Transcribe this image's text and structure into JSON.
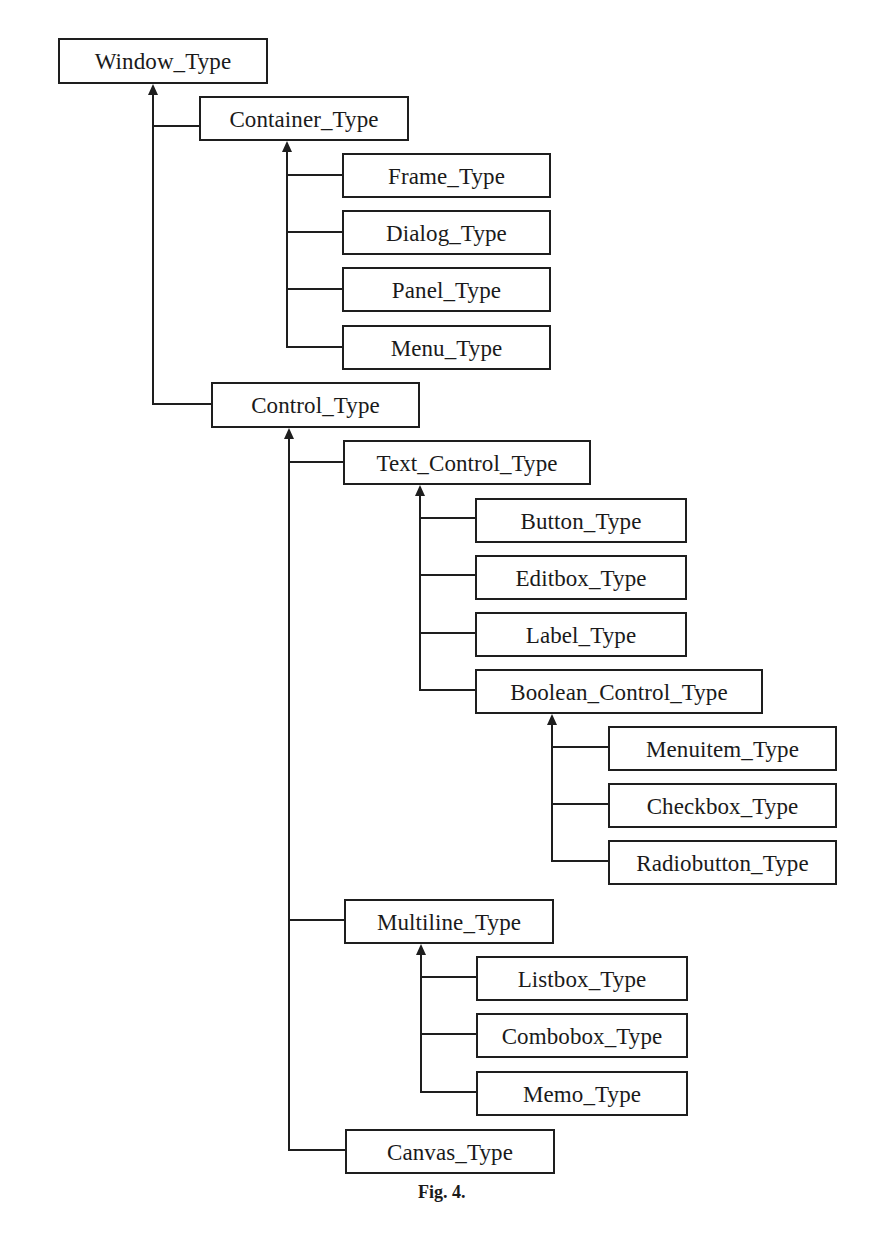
{
  "figure": {
    "caption": "Fig. 4.",
    "caption_pos": {
      "x": 418,
      "y": 1182
    },
    "line_color": "#1e1e1e",
    "background": "#ffffff"
  },
  "nodes": [
    {
      "id": "window",
      "label": "Window_Type",
      "x": 58,
      "y": 38,
      "w": 210,
      "h": 46
    },
    {
      "id": "container",
      "label": "Container_Type",
      "x": 199,
      "y": 96,
      "w": 210,
      "h": 45
    },
    {
      "id": "frame",
      "label": "Frame_Type",
      "x": 342,
      "y": 153,
      "w": 209,
      "h": 45
    },
    {
      "id": "dialog",
      "label": "Dialog_Type",
      "x": 342,
      "y": 210,
      "w": 209,
      "h": 45
    },
    {
      "id": "panel",
      "label": "Panel_Type",
      "x": 342,
      "y": 267,
      "w": 209,
      "h": 45
    },
    {
      "id": "menu",
      "label": "Menu_Type",
      "x": 342,
      "y": 325,
      "w": 209,
      "h": 45
    },
    {
      "id": "control",
      "label": "Control_Type",
      "x": 211,
      "y": 382,
      "w": 209,
      "h": 46
    },
    {
      "id": "textcontrol",
      "label": "Text_Control_Type",
      "x": 343,
      "y": 440,
      "w": 248,
      "h": 45
    },
    {
      "id": "button",
      "label": "Button_Type",
      "x": 475,
      "y": 498,
      "w": 212,
      "h": 45
    },
    {
      "id": "editbox",
      "label": "Editbox_Type",
      "x": 475,
      "y": 555,
      "w": 212,
      "h": 45
    },
    {
      "id": "label",
      "label": "Label_Type",
      "x": 475,
      "y": 612,
      "w": 212,
      "h": 45
    },
    {
      "id": "boolean",
      "label": "Boolean_Control_Type",
      "x": 475,
      "y": 669,
      "w": 288,
      "h": 45
    },
    {
      "id": "menuitem",
      "label": "Menuitem_Type",
      "x": 608,
      "y": 726,
      "w": 229,
      "h": 45
    },
    {
      "id": "checkbox",
      "label": "Checkbox_Type",
      "x": 608,
      "y": 783,
      "w": 229,
      "h": 45
    },
    {
      "id": "radiobutton",
      "label": "Radiobutton_Type",
      "x": 608,
      "y": 840,
      "w": 229,
      "h": 45
    },
    {
      "id": "multiline",
      "label": "Multiline_Type",
      "x": 344,
      "y": 899,
      "w": 210,
      "h": 45
    },
    {
      "id": "listbox",
      "label": "Listbox_Type",
      "x": 476,
      "y": 956,
      "w": 212,
      "h": 45
    },
    {
      "id": "combobox",
      "label": "Combobox_Type",
      "x": 476,
      "y": 1013,
      "w": 212,
      "h": 45
    },
    {
      "id": "memo",
      "label": "Memo_Type",
      "x": 476,
      "y": 1071,
      "w": 212,
      "h": 45
    },
    {
      "id": "canvas",
      "label": "Canvas_Type",
      "x": 345,
      "y": 1129,
      "w": 210,
      "h": 45
    }
  ],
  "trunks": [
    {
      "parent": "window",
      "x": 153,
      "top": 84,
      "bottom": 404,
      "children": [
        {
          "child": "container",
          "y": 126,
          "to_x": 199
        },
        {
          "child": "control",
          "y": 404,
          "to_x": 211
        }
      ]
    },
    {
      "parent": "container",
      "x": 287,
      "top": 141,
      "bottom": 347,
      "children": [
        {
          "child": "frame",
          "y": 175,
          "to_x": 342
        },
        {
          "child": "dialog",
          "y": 232,
          "to_x": 342
        },
        {
          "child": "panel",
          "y": 289,
          "to_x": 342
        },
        {
          "child": "menu",
          "y": 347,
          "to_x": 342
        }
      ]
    },
    {
      "parent": "control",
      "x": 289,
      "top": 428,
      "bottom": 1150,
      "children": [
        {
          "child": "textcontrol",
          "y": 462,
          "to_x": 343
        },
        {
          "child": "multiline",
          "y": 920,
          "to_x": 344
        },
        {
          "child": "canvas",
          "y": 1150,
          "to_x": 345
        }
      ]
    },
    {
      "parent": "textcontrol",
      "x": 420,
      "top": 485,
      "bottom": 690,
      "children": [
        {
          "child": "button",
          "y": 518,
          "to_x": 475
        },
        {
          "child": "editbox",
          "y": 575,
          "to_x": 475
        },
        {
          "child": "label",
          "y": 633,
          "to_x": 475
        },
        {
          "child": "boolean",
          "y": 690,
          "to_x": 475
        }
      ]
    },
    {
      "parent": "boolean",
      "x": 552,
      "top": 714,
      "bottom": 861,
      "children": [
        {
          "child": "menuitem",
          "y": 747,
          "to_x": 608
        },
        {
          "child": "checkbox",
          "y": 804,
          "to_x": 608
        },
        {
          "child": "radiobutton",
          "y": 861,
          "to_x": 608
        }
      ]
    },
    {
      "parent": "multiline",
      "x": 421,
      "top": 944,
      "bottom": 1092,
      "children": [
        {
          "child": "listbox",
          "y": 977,
          "to_x": 476
        },
        {
          "child": "combobox",
          "y": 1034,
          "to_x": 476
        },
        {
          "child": "memo",
          "y": 1092,
          "to_x": 476
        }
      ]
    }
  ]
}
